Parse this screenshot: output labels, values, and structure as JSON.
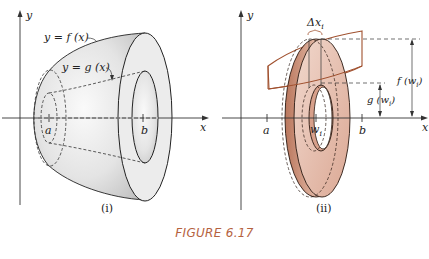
{
  "figure": {
    "caption": "FIGURE 6.17",
    "caption_color": "#b5623f",
    "panels": [
      {
        "id": "i",
        "label": "(i)",
        "axis_x_label": "x",
        "axis_y_label": "y",
        "curve_outer_label": "y = f (x)",
        "curve_inner_label": "y = g (x)",
        "tick_a": "a",
        "tick_b": "b",
        "solid_color": "#d9d9d9"
      },
      {
        "id": "ii",
        "label": "(ii)",
        "axis_x_label": "x",
        "axis_y_label": "y",
        "delta_label": "Δx",
        "delta_sub": "i",
        "tick_a": "a",
        "tick_w": "w",
        "tick_w_sub": "i",
        "tick_b": "b",
        "outer_radius_label": "f (w",
        "outer_radius_sub": "i",
        "inner_radius_label": "g (w",
        "inner_radius_sub": "i",
        "washer_color": "#c98f78",
        "outline_color": "#a0502e"
      }
    ]
  }
}
